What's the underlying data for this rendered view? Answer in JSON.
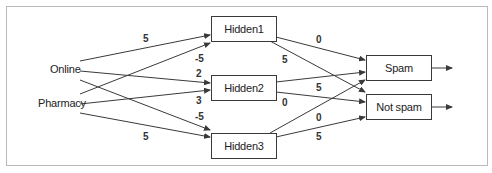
{
  "diagram": {
    "type": "neural-network",
    "inputs": [
      {
        "id": "online",
        "label": "Online"
      },
      {
        "id": "pharmacy",
        "label": "Pharmacy"
      }
    ],
    "hidden": [
      {
        "id": "h1",
        "label": "Hidden1"
      },
      {
        "id": "h2",
        "label": "Hidden2"
      },
      {
        "id": "h3",
        "label": "Hidden3"
      }
    ],
    "outputs": [
      {
        "id": "spam",
        "label": "Spam"
      },
      {
        "id": "notspam",
        "label": "Not spam"
      }
    ],
    "input_weights": [
      {
        "from": "online",
        "to": "h1",
        "weight": "5"
      },
      {
        "from": "pharmacy",
        "to": "h1",
        "weight": "-5"
      },
      {
        "from": "online",
        "to": "h2",
        "weight": "2"
      },
      {
        "from": "pharmacy",
        "to": "h2",
        "weight": "3"
      },
      {
        "from": "online",
        "to": "h3",
        "weight": "-5"
      },
      {
        "from": "pharmacy",
        "to": "h3",
        "weight": "5"
      }
    ],
    "output_weights": [
      {
        "from": "h1",
        "to": "spam",
        "weight": "0"
      },
      {
        "from": "h1",
        "to": "notspam",
        "weight": "5"
      },
      {
        "from": "h2",
        "to": "spam",
        "weight": "5"
      },
      {
        "from": "h2",
        "to": "notspam",
        "weight": "0"
      },
      {
        "from": "h3",
        "to": "spam",
        "weight": "0"
      },
      {
        "from": "h3",
        "to": "notspam",
        "weight": "5"
      }
    ],
    "colors": {
      "line": "#3a3a3a",
      "frame": "#b9b9b9",
      "text": "#222222"
    }
  }
}
